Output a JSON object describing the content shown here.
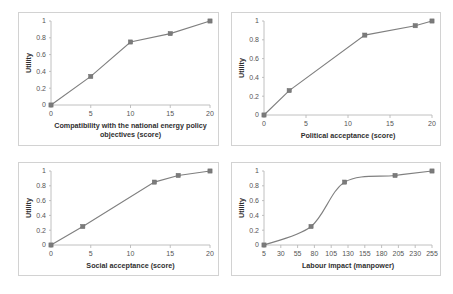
{
  "figure": {
    "background_color": "#ffffff",
    "panel_border_color": "#d2d2d2",
    "series_color": "#7f7f7f",
    "axis_color": "#b9b9b9",
    "tick_label_color": "#555555",
    "axis_title_color": "#2f2f2f",
    "panel_count": 4,
    "layout": "2x2"
  },
  "chart_data": [
    {
      "type": "line",
      "panel": "top-left",
      "title": "",
      "xlabel": "Compatibility with the national energy policy objectives (score)",
      "xlabel_lines": [
        "Compatibility with the national energy policy",
        "objectives (score)"
      ],
      "ylabel": "Utility",
      "x": [
        0,
        5,
        10,
        15,
        20
      ],
      "values": [
        0,
        0.34,
        0.75,
        0.85,
        1
      ],
      "xlim": [
        0,
        20
      ],
      "ylim": [
        0,
        1
      ],
      "xticks": [
        0,
        5,
        10,
        15,
        20
      ],
      "xtick_labels": [
        "0",
        "5",
        "10",
        "15",
        "20"
      ],
      "yticks": [
        0,
        0.2,
        0.4,
        0.6,
        0.8,
        1
      ],
      "ytick_labels": [
        "0",
        "0.2",
        "0.4",
        "0.6",
        "0.8",
        "1"
      ],
      "markers": true,
      "grid": false,
      "legend": "none"
    },
    {
      "type": "line",
      "panel": "top-right",
      "title": "",
      "xlabel": "Political acceptance (score)",
      "xlabel_lines": [
        "Political acceptance (score)"
      ],
      "ylabel": "Utility",
      "x": [
        0,
        3,
        12,
        18,
        20
      ],
      "values": [
        0,
        0.26,
        0.85,
        0.95,
        1
      ],
      "xlim": [
        0,
        20
      ],
      "ylim": [
        0,
        1
      ],
      "xticks": [
        0,
        5,
        10,
        15,
        20
      ],
      "xtick_labels": [
        "0",
        "5",
        "10",
        "15",
        "20"
      ],
      "yticks": [
        0,
        0.2,
        0.4,
        0.6,
        0.8,
        1
      ],
      "ytick_labels": [
        "0",
        "0.2",
        "0.4",
        "0.6",
        "0.8",
        "1"
      ],
      "markers": true,
      "grid": false,
      "legend": "none"
    },
    {
      "type": "line",
      "panel": "bottom-left",
      "title": "",
      "xlabel": "Social acceptance (score)",
      "xlabel_lines": [
        "Social acceptance (score)"
      ],
      "ylabel": "Utility",
      "x": [
        0,
        4,
        13,
        16,
        20
      ],
      "values": [
        0,
        0.25,
        0.85,
        0.94,
        1
      ],
      "xlim": [
        0,
        20
      ],
      "ylim": [
        0,
        1
      ],
      "xticks": [
        0,
        5,
        10,
        15,
        20
      ],
      "xtick_labels": [
        "0",
        "5",
        "10",
        "15",
        "20"
      ],
      "yticks": [
        0,
        0.2,
        0.4,
        0.6,
        0.8,
        1
      ],
      "ytick_labels": [
        "0",
        "0.2",
        "0.4",
        "0.6",
        "0.8",
        "1"
      ],
      "markers": true,
      "grid": false,
      "legend": "none"
    },
    {
      "type": "line",
      "panel": "bottom-right",
      "title": "",
      "xlabel": "Labour impact (manpower)",
      "xlabel_lines": [
        "Labour impact (manpower)"
      ],
      "ylabel": "Utility",
      "x": [
        5,
        75,
        125,
        200,
        255
      ],
      "values": [
        0,
        0.25,
        0.85,
        0.94,
        1
      ],
      "xlim": [
        5,
        255
      ],
      "ylim": [
        0,
        1
      ],
      "xticks": [
        5,
        30,
        55,
        80,
        105,
        130,
        155,
        180,
        205,
        230,
        255
      ],
      "xtick_labels": [
        "5",
        "30",
        "55",
        "80",
        "105",
        "130",
        "155",
        "180",
        "205",
        "230",
        "255"
      ],
      "yticks": [
        0,
        0.2,
        0.4,
        0.6,
        0.8,
        1
      ],
      "ytick_labels": [
        "0",
        "0.2",
        "0.4",
        "0.6",
        "0.8",
        "1"
      ],
      "markers": true,
      "grid": false,
      "legend": "none",
      "smooth": true
    }
  ]
}
